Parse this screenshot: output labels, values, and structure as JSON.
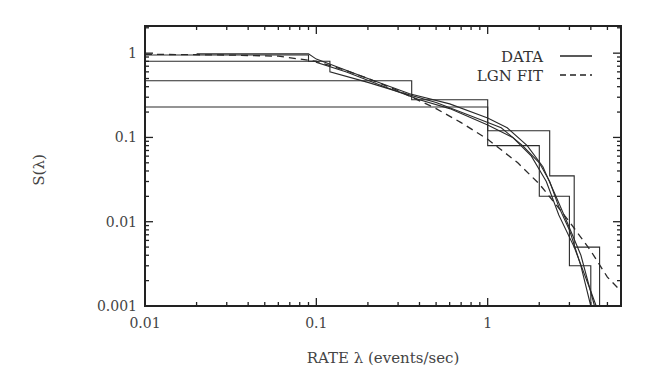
{
  "chart_data": {
    "type": "line",
    "title": "",
    "xlabel": "RATE λ (events/sec)",
    "ylabel": "S(λ)",
    "xscale": "log",
    "yscale": "log",
    "xlim": [
      0.01,
      6
    ],
    "ylim": [
      0.001,
      2.1
    ],
    "grid": false,
    "legend_position": "upper right",
    "x_tick_labels": [
      "0.01",
      "0.1",
      "1"
    ],
    "x_ticks": [
      0.01,
      0.1,
      1
    ],
    "y_tick_labels": [
      "0.001",
      "0.01",
      "0.1",
      "1"
    ],
    "y_ticks": [
      0.001,
      0.01,
      0.1,
      1
    ],
    "legend": [
      {
        "label": "DATA",
        "style": "solid"
      },
      {
        "label": "LGN FIT",
        "style": "dashed"
      }
    ],
    "series": [
      {
        "name": "DATA",
        "style": "step",
        "points": [
          [
            0.01,
            0.95
          ],
          [
            0.09,
            0.95
          ],
          [
            0.09,
            0.8
          ],
          [
            0.12,
            0.8
          ],
          [
            0.12,
            0.6
          ],
          [
            0.2,
            0.45
          ],
          [
            0.3,
            0.35
          ],
          [
            0.5,
            0.26
          ],
          [
            0.8,
            0.18
          ],
          [
            1.2,
            0.13
          ],
          [
            1.6,
            0.08
          ],
          [
            2.0,
            0.05
          ],
          [
            2.3,
            0.03
          ],
          [
            2.6,
            0.015
          ],
          [
            3.0,
            0.008
          ],
          [
            3.5,
            0.003
          ],
          [
            4.0,
            0.001
          ]
        ]
      },
      {
        "name": "DATA",
        "style": "step",
        "points": [
          [
            0.01,
            0.8
          ],
          [
            0.1,
            0.8
          ],
          [
            0.1,
            0.78
          ],
          [
            0.15,
            0.6
          ],
          [
            0.25,
            0.4
          ],
          [
            0.4,
            0.28
          ],
          [
            0.6,
            0.22
          ],
          [
            1.0,
            0.14
          ],
          [
            1.4,
            0.1
          ],
          [
            1.8,
            0.06
          ],
          [
            2.2,
            0.03
          ],
          [
            2.6,
            0.012
          ],
          [
            3.2,
            0.005
          ],
          [
            4.0,
            0.0015
          ],
          [
            4.3,
            0.001
          ]
        ]
      },
      {
        "name": "DATA",
        "style": "step",
        "points": [
          [
            0.01,
            0.47
          ],
          [
            0.36,
            0.47
          ],
          [
            0.36,
            0.28
          ],
          [
            1.0,
            0.28
          ],
          [
            1.0,
            0.12
          ],
          [
            2.3,
            0.12
          ],
          [
            2.3,
            0.035
          ],
          [
            3.2,
            0.035
          ],
          [
            3.2,
            0.005
          ],
          [
            4.5,
            0.005
          ],
          [
            4.5,
            0.001
          ]
        ]
      },
      {
        "name": "DATA",
        "style": "step",
        "points": [
          [
            0.01,
            0.23
          ],
          [
            1.0,
            0.23
          ],
          [
            1.0,
            0.08
          ],
          [
            2.0,
            0.08
          ],
          [
            2.0,
            0.02
          ],
          [
            3.0,
            0.02
          ],
          [
            3.0,
            0.003
          ],
          [
            4.0,
            0.003
          ],
          [
            4.0,
            0.001
          ]
        ]
      },
      {
        "name": "DATA",
        "style": "step",
        "points": [
          [
            0.02,
            0.98
          ],
          [
            0.09,
            0.98
          ],
          [
            0.1,
            0.85
          ],
          [
            0.2,
            0.5
          ],
          [
            0.35,
            0.33
          ],
          [
            0.6,
            0.25
          ],
          [
            1.0,
            0.17
          ],
          [
            1.3,
            0.13
          ],
          [
            1.7,
            0.08
          ],
          [
            2.1,
            0.045
          ],
          [
            2.5,
            0.02
          ],
          [
            2.9,
            0.01
          ],
          [
            3.5,
            0.004
          ],
          [
            4.2,
            0.001
          ]
        ]
      },
      {
        "name": "LGN FIT",
        "style": "dashed",
        "points": [
          [
            0.01,
            0.97
          ],
          [
            0.03,
            0.95
          ],
          [
            0.06,
            0.92
          ],
          [
            0.1,
            0.8
          ],
          [
            0.15,
            0.62
          ],
          [
            0.2,
            0.5
          ],
          [
            0.3,
            0.36
          ],
          [
            0.5,
            0.22
          ],
          [
            0.7,
            0.15
          ],
          [
            1.0,
            0.095
          ],
          [
            1.5,
            0.05
          ],
          [
            2.0,
            0.028
          ],
          [
            2.5,
            0.016
          ],
          [
            3.0,
            0.01
          ],
          [
            4.0,
            0.0045
          ],
          [
            5.0,
            0.0022
          ],
          [
            6.0,
            0.0015
          ]
        ]
      }
    ]
  }
}
